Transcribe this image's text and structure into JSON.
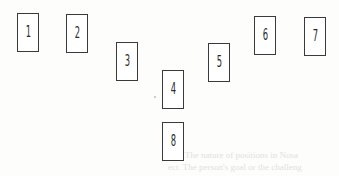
{
  "diagram": {
    "type": "card-spread-layout",
    "cards": [
      {
        "label": "1",
        "x": 17,
        "y": 13
      },
      {
        "label": "2",
        "x": 66,
        "y": 14
      },
      {
        "label": "3",
        "x": 116,
        "y": 42
      },
      {
        "label": "4",
        "x": 162,
        "y": 70
      },
      {
        "label": "5",
        "x": 208,
        "y": 43
      },
      {
        "label": "6",
        "x": 254,
        "y": 16
      },
      {
        "label": "7",
        "x": 304,
        "y": 17
      },
      {
        "label": "8",
        "x": 162,
        "y": 122
      }
    ]
  },
  "bleed_through": {
    "line1": "ney. The nature of positions in Nosa",
    "line2": "ect. The person's goal or the challeng"
  }
}
